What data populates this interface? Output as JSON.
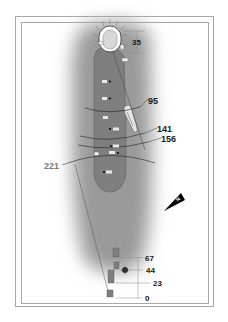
{
  "hole": {
    "green_depth": "35",
    "distance_markers": [
      {
        "label": "95",
        "x": 148,
        "y": 101
      },
      {
        "label": "141",
        "x": 157,
        "y": 130
      },
      {
        "label": "156",
        "x": 161,
        "y": 140
      },
      {
        "label": "221",
        "x": 44,
        "y": 169
      }
    ],
    "tee_markers": [
      {
        "label": "67",
        "y": 258
      },
      {
        "label": "44",
        "y": 270
      },
      {
        "label": "23",
        "y": 283
      },
      {
        "label": "0",
        "y": 298
      }
    ],
    "fairway_yardage_plates": [
      "40",
      "78",
      "96",
      "123",
      "146",
      "152",
      "182"
    ],
    "compass": {
      "label": "N",
      "icon": "north-arrow-icon"
    }
  },
  "colors": {
    "fairway": "#7f7f7f",
    "rough_dark": "#8a8a8a",
    "green": "#d9d9d9",
    "frame": "#a8a8a8",
    "line": "#3a3a3a",
    "text": "#1a1a1a"
  }
}
